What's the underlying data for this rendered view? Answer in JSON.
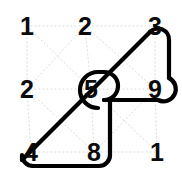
{
  "canvas": {
    "width": 182,
    "height": 178,
    "background": "#ffffff"
  },
  "style": {
    "grid_line_color": "#d8d8d8",
    "path_color": "#000000",
    "number_color": "#0b0b0b",
    "path_stroke_width": 4.2,
    "grid_stroke_width": 1,
    "grid_dash": "1 3"
  },
  "grid": {
    "rows": 3,
    "cols": 3,
    "node_spacing_x": 58,
    "node_spacing_y": 56,
    "origin_x": 27,
    "origin_y": 26,
    "nodes": [
      {
        "id": "r0c0",
        "row": 0,
        "col": 0,
        "value": "1",
        "x": 27,
        "y": 26,
        "on_path": false
      },
      {
        "id": "r0c1",
        "row": 0,
        "col": 1,
        "value": "2",
        "x": 85,
        "y": 26,
        "on_path": false
      },
      {
        "id": "r0c2",
        "row": 0,
        "col": 2,
        "value": "3",
        "x": 155,
        "y": 26,
        "on_path": true
      },
      {
        "id": "r1c0",
        "row": 1,
        "col": 0,
        "value": "2",
        "x": 27,
        "y": 89,
        "on_path": false
      },
      {
        "id": "r1c1",
        "row": 1,
        "col": 1,
        "value": "5",
        "x": 91,
        "y": 89,
        "on_path": true
      },
      {
        "id": "r1c2",
        "row": 1,
        "col": 2,
        "value": "9",
        "x": 155,
        "y": 89,
        "on_path": true
      },
      {
        "id": "r2c0",
        "row": 2,
        "col": 0,
        "value": "4",
        "x": 31,
        "y": 152,
        "on_path": true
      },
      {
        "id": "r2c1",
        "row": 2,
        "col": 1,
        "value": "8",
        "x": 94,
        "y": 152,
        "on_path": true
      },
      {
        "id": "r2c2",
        "row": 2,
        "col": 2,
        "value": "1",
        "x": 157,
        "y": 152,
        "on_path": false
      }
    ]
  },
  "connections": {
    "description": "faint dotted lattice joining adjacent cells horizontally, vertically and diagonally",
    "segments": [
      {
        "from": "r0c0",
        "to": "r0c1"
      },
      {
        "from": "r0c1",
        "to": "r0c2"
      },
      {
        "from": "r1c0",
        "to": "r1c1"
      },
      {
        "from": "r1c1",
        "to": "r1c2"
      },
      {
        "from": "r2c0",
        "to": "r2c1"
      },
      {
        "from": "r2c1",
        "to": "r2c2"
      },
      {
        "from": "r0c0",
        "to": "r1c0"
      },
      {
        "from": "r1c0",
        "to": "r2c0"
      },
      {
        "from": "r0c1",
        "to": "r1c1"
      },
      {
        "from": "r1c1",
        "to": "r2c1"
      },
      {
        "from": "r0c2",
        "to": "r1c2"
      },
      {
        "from": "r1c2",
        "to": "r2c2"
      },
      {
        "from": "r0c0",
        "to": "r1c1"
      },
      {
        "from": "r1c1",
        "to": "r2c2"
      },
      {
        "from": "r0c1",
        "to": "r1c2"
      },
      {
        "from": "r1c0",
        "to": "r2c1"
      },
      {
        "from": "r0c1",
        "to": "r1c0"
      },
      {
        "from": "r1c1",
        "to": "r2c0"
      },
      {
        "from": "r0c2",
        "to": "r1c1"
      },
      {
        "from": "r1c2",
        "to": "r2c1"
      }
    ]
  },
  "path": {
    "label": "traced-route",
    "closed": true,
    "sequence": [
      "4",
      "5",
      "3",
      "9",
      "5",
      "8",
      "4"
    ],
    "node_sequence": [
      "r2c0",
      "r1c1",
      "r0c2",
      "r1c2",
      "r1c1",
      "r2c1",
      "r2c0"
    ],
    "svg_d": "M 31 166 L 97 100 L 155 42 M 31 166 L 97 100 L 155 42"
  }
}
